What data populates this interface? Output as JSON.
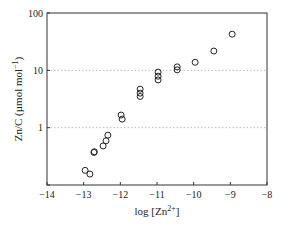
{
  "chart_data": {
    "type": "scatter",
    "title": "",
    "xlabel": "log [Zn2+]",
    "xlabel_parts": {
      "base": "log [Zn",
      "sup": "2+",
      "tail": "]"
    },
    "ylabel": "Zn/C (µmol mol-1)",
    "ylabel_parts": {
      "base": "Zn/C (µmol mol",
      "sup": "−1",
      "tail": ")"
    },
    "xlim": [
      -14,
      -8
    ],
    "ylim": [
      0.1,
      100
    ],
    "yscale": "log",
    "x_ticks": [
      -14,
      -13,
      -12,
      -11,
      -10,
      -9,
      -8
    ],
    "x_tick_labels": [
      "−14",
      "−13",
      "−12",
      "−11",
      "−10",
      "−9",
      "−8"
    ],
    "y_ticks": [
      0.1,
      1,
      10,
      100
    ],
    "y_tick_labels": [
      "",
      "1",
      "10",
      "100"
    ],
    "grid": {
      "horizontal_dotted_at": [
        1,
        10
      ],
      "color": "#bbbbbb"
    },
    "legend": null,
    "marker": "open-circle",
    "series": [
      {
        "name": "Zn/C",
        "x": [
          -12.96,
          -12.83,
          -12.72,
          -12.71,
          -12.47,
          -12.39,
          -12.34,
          -11.98,
          -11.95,
          -11.46,
          -11.46,
          -11.46,
          -10.97,
          -10.97,
          -10.97,
          -10.45,
          -10.45,
          -9.96,
          -9.45,
          -8.95
        ],
        "y": [
          0.18,
          0.155,
          0.37,
          0.38,
          0.48,
          0.59,
          0.74,
          1.66,
          1.41,
          4.7,
          4.0,
          3.5,
          9.3,
          7.9,
          6.8,
          11.5,
          10.2,
          13.8,
          21.7,
          42.7
        ]
      }
    ]
  }
}
